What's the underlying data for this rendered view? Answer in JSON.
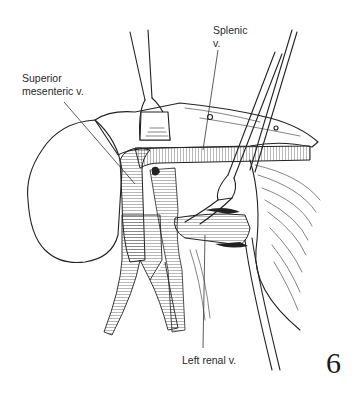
{
  "figure": {
    "number": "6",
    "labels": {
      "splenic_line1": "Splenic",
      "splenic_line2": "v.",
      "sma_line1": "Superior",
      "sma_line2": "mesenteric v.",
      "left_renal": "Left renal v."
    },
    "structures": [
      "pancreas",
      "splenic-vein",
      "superior-mesenteric-vein",
      "left-renal-vein",
      "inferior-vena-cava-bifurcation",
      "retractor-left",
      "retractor-right",
      "probe"
    ],
    "colors": {
      "background": "#ffffff",
      "ink": "#222222"
    }
  }
}
